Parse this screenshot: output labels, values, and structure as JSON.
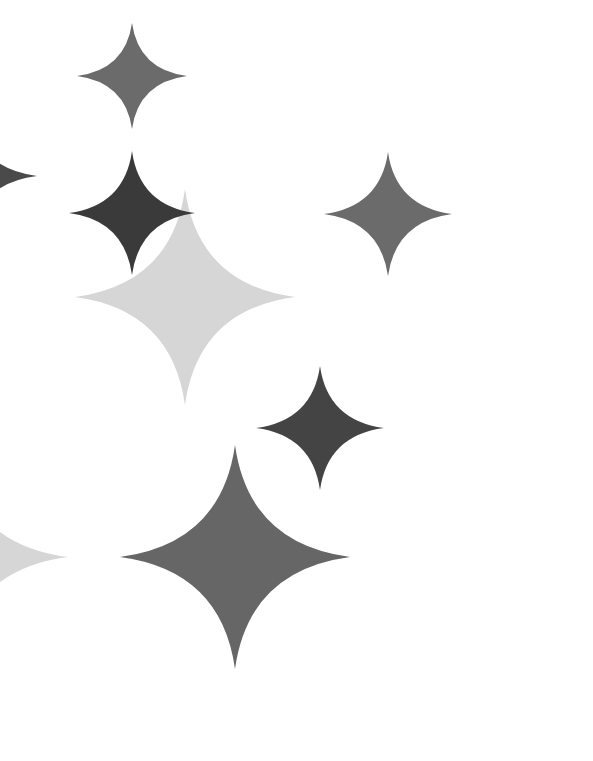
{
  "canvas": {
    "width": 593,
    "height": 761,
    "background": "#ffffff"
  },
  "stars": [
    {
      "name": "sparkle-top",
      "cx": 132,
      "cy": 76,
      "rx": 55,
      "ry": 53,
      "color": "#6b6b6b"
    },
    {
      "name": "sparkle-large-light",
      "cx": 185,
      "cy": 297,
      "rx": 110,
      "ry": 108,
      "color": "#d6d6d6"
    },
    {
      "name": "sparkle-dark-upper",
      "cx": 132,
      "cy": 213,
      "rx": 63,
      "ry": 62,
      "color": "#3a3a3a"
    },
    {
      "name": "sparkle-right",
      "cx": 388,
      "cy": 214,
      "rx": 64,
      "ry": 62,
      "color": "#6b6b6b"
    },
    {
      "name": "sparkle-dark-middle",
      "cx": 320,
      "cy": 428,
      "rx": 64,
      "ry": 62,
      "color": "#444444"
    },
    {
      "name": "sparkle-large-bottom",
      "cx": 235,
      "cy": 557,
      "rx": 115,
      "ry": 112,
      "color": "#666666"
    },
    {
      "name": "sparkle-partial-left-dark",
      "cx": -30,
      "cy": 176,
      "rx": 67,
      "ry": 62,
      "color": "#4a4a4a"
    },
    {
      "name": "sparkle-partial-left-light",
      "cx": -45,
      "cy": 557,
      "rx": 113,
      "ry": 108,
      "color": "#d6d6d6"
    }
  ]
}
